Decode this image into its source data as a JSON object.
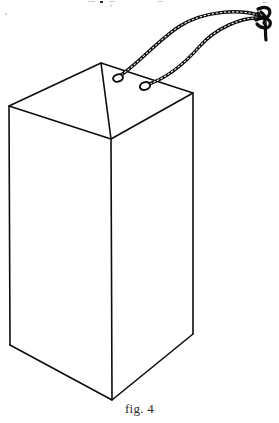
{
  "figure": {
    "caption": "fig. 4",
    "style": "black-and-white line drawing",
    "background_color": "#ffffff",
    "line_color": "#0d0d0d",
    "canvas": {
      "width": 279,
      "height": 423
    },
    "parts": {
      "box_label": "carton",
      "cord_label": "braided cord",
      "eyelet_label": "eyelet",
      "knot_label": "knot"
    },
    "box": {
      "name": "carton-body",
      "projection": "oblique",
      "open_top": true,
      "vertices": {
        "top_back": [
          101,
          63
        ],
        "top_left": [
          9,
          106
        ],
        "top_right": [
          193,
          93
        ],
        "top_front": [
          111,
          139
        ],
        "bot_left": [
          10,
          345
        ],
        "bot_right": [
          193,
          334
        ],
        "bot_front": [
          112,
          400
        ]
      }
    },
    "cords": [
      {
        "name": "cord-upper",
        "from_eyelet": [
          118,
          78
        ],
        "to_knot": [
          262,
          17
        ],
        "arc_peak": [
          196,
          16
        ]
      },
      {
        "name": "cord-lower",
        "from_eyelet": [
          145,
          86
        ],
        "to_knot": [
          262,
          20
        ],
        "arc_peak": [
          215,
          35
        ]
      }
    ],
    "eyelets": [
      {
        "name": "eyelet-left",
        "center": [
          118,
          78
        ],
        "rx": 5.0,
        "ry": 3.6
      },
      {
        "name": "eyelet-right",
        "center": [
          145,
          86
        ],
        "rx": 5.2,
        "ry": 3.8
      }
    ],
    "knot": {
      "name": "cord-knot",
      "center": [
        264,
        16
      ],
      "tail_end": [
        266,
        40
      ]
    }
  }
}
